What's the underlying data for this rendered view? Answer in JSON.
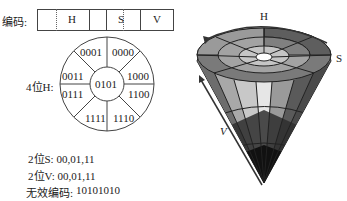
{
  "encoding": {
    "label": "编码:",
    "cells": [
      "",
      "H",
      "",
      "S",
      "V"
    ]
  },
  "hue_wheel": {
    "label": "4位H:",
    "center_code": "0101",
    "sectors": [
      "0000",
      "1000",
      "1100",
      "1110",
      "1111",
      "0111",
      "0011",
      "0001"
    ]
  },
  "notes": {
    "s_bits": "2位S: 00,01,11",
    "v_bits": "2位V: 00,01,11",
    "invalid_label": "无效编码:",
    "invalid_code": "10101010"
  },
  "cone": {
    "h_label": "H",
    "s_label": "S",
    "v_label": "V"
  }
}
